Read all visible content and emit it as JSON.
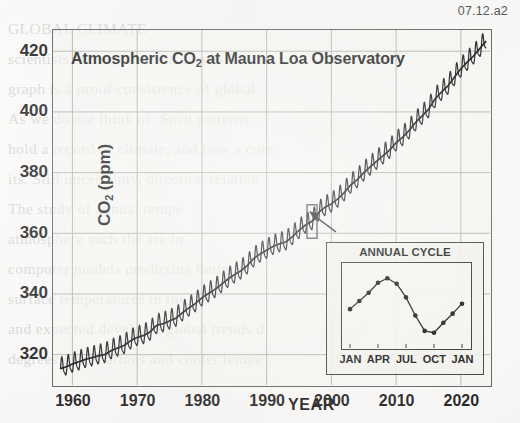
{
  "figure": {
    "label": "07.12.a2",
    "title": "Atmospheric CO2 at Mauna Loa Observatory",
    "title_main": "Atmospheric CO",
    "title_sub": "2",
    "title_rest": " at Mauna Loa Observatory"
  },
  "axes": {
    "ylabel_main": "CO",
    "ylabel_sub": "2",
    "ylabel_rest": " (ppm)",
    "ylabel": "CO2 (ppm)",
    "xlabel": "YEAR",
    "yticks": [
      "320",
      "340",
      "360",
      "380",
      "400",
      "420"
    ],
    "xticks": [
      "1960",
      "1970",
      "1980",
      "1990",
      "2000",
      "2010",
      "2020"
    ]
  },
  "inset": {
    "title": "ANNUAL CYCLE",
    "xticks": [
      "JAN",
      "APR",
      "JUL",
      "OCT",
      "JAN"
    ]
  },
  "bleed_text": [
    "GLOBAL CLIMATE",
    "scientists and say that the curves on the",
    "graph is a proof consistence of global",
    "As we do not think of. Such patterns",
    "hold a record of climate, and how a core",
    "its. Still uncertainty, direction relation",
    "The study of annual tempe",
    "atmosphere such the are in",
    "computer models predicting better s",
    "surface temperatures in the",
    "and expected develop a global trends d",
    "degrees of variations and cooler tempe"
  ],
  "chart_data": {
    "type": "line",
    "title": "Atmospheric CO2 at Mauna Loa Observatory",
    "xlabel": "YEAR",
    "ylabel": "CO2 (ppm)",
    "xlim": [
      1957,
      2024.5
    ],
    "ylim": [
      310,
      427
    ],
    "grid": true,
    "legend": "none",
    "annotation_box": {
      "year_center": 1997,
      "label": "zoom region expanded in inset"
    },
    "series": [
      {
        "name": "Annual mean CO2 (ppm)",
        "x": [
          1958,
          1959,
          1960,
          1961,
          1962,
          1963,
          1964,
          1965,
          1966,
          1967,
          1968,
          1969,
          1970,
          1971,
          1972,
          1973,
          1974,
          1975,
          1976,
          1977,
          1978,
          1979,
          1980,
          1981,
          1982,
          1983,
          1984,
          1985,
          1986,
          1987,
          1988,
          1989,
          1990,
          1991,
          1992,
          1993,
          1994,
          1995,
          1996,
          1997,
          1998,
          1999,
          2000,
          2001,
          2002,
          2003,
          2004,
          2005,
          2006,
          2007,
          2008,
          2009,
          2010,
          2011,
          2012,
          2013,
          2014,
          2015,
          2016,
          2017,
          2018,
          2019,
          2020,
          2021,
          2022,
          2023
        ],
        "values": [
          315.3,
          315.98,
          316.91,
          317.64,
          318.45,
          318.99,
          319.62,
          320.04,
          321.37,
          322.18,
          323.05,
          324.62,
          325.68,
          326.32,
          327.46,
          329.68,
          330.19,
          331.12,
          332.03,
          333.84,
          335.41,
          336.84,
          338.76,
          340.12,
          341.48,
          343.15,
          344.87,
          346.35,
          347.61,
          349.31,
          351.69,
          353.2,
          354.45,
          355.7,
          356.54,
          357.21,
          358.96,
          360.97,
          362.74,
          363.88,
          366.84,
          368.54,
          369.71,
          371.32,
          373.45,
          375.98,
          377.7,
          379.98,
          381.9,
          383.79,
          385.6,
          387.43,
          389.9,
          391.65,
          393.85,
          396.52,
          398.65,
          400.83,
          404.24,
          406.55,
          408.52,
          411.44,
          414.24,
          416.45,
          418.56,
          421.08
        ]
      }
    ],
    "inset_chart": {
      "type": "line",
      "title": "ANNUAL CYCLE",
      "categories": [
        "JAN",
        "FEB",
        "MAR",
        "APR",
        "MAY",
        "JUN",
        "JUL",
        "AUG",
        "SEP",
        "OCT",
        "NOV",
        "DEC",
        "JAN"
      ],
      "tick_labels": [
        "JAN",
        "APR",
        "JUL",
        "OCT",
        "JAN"
      ],
      "values": [
        363.0,
        363.9,
        364.8,
        365.9,
        366.4,
        365.8,
        364.3,
        362.3,
        360.6,
        360.4,
        361.5,
        362.5,
        363.6
      ],
      "ylabel": "CO2 (ppm)",
      "notes": "Seasonal cycle within one year: maximum in May, minimum in late September / early October, approx 6 ppm amplitude."
    }
  }
}
